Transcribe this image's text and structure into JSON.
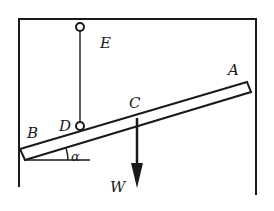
{
  "diagram": {
    "type": "statics-bar-hinged-with-string",
    "colors": {
      "stroke": "#1a1a1a",
      "background": "#ffffff"
    },
    "labels": {
      "A": "A",
      "B": "B",
      "C": "C",
      "D": "D",
      "E": "E",
      "W": "W",
      "alpha": "α"
    },
    "elements": [
      {
        "name": "frame",
        "description": "Rectangular enclosure open at the bottom (walls and ceiling)"
      },
      {
        "name": "pivot-E",
        "description": "Small circle on ceiling at point E"
      },
      {
        "name": "string-ED",
        "description": "Vertical string from E to D"
      },
      {
        "name": "pivot-D",
        "description": "Small circle attaching string to bar at D"
      },
      {
        "name": "bar-AB",
        "description": "Inclined bar from B (left wall) to A (right wall)"
      },
      {
        "name": "weight-arrow-W",
        "description": "Downward force arrow W applied at C"
      },
      {
        "name": "angle-alpha",
        "description": "Angle α between bar and horizontal at B"
      }
    ]
  }
}
